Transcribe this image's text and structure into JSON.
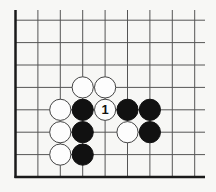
{
  "diagram": {
    "type": "go-board-fragment",
    "grid": {
      "origin_x": 15.5,
      "origin_y": 177,
      "spacing": 22.4,
      "cols": 9,
      "rows": 8,
      "top_y": 10,
      "right_x": 205
    },
    "colors": {
      "background": "#f7f7f5",
      "line": "#555555",
      "black_stone": "#111111",
      "white_stone": "#fdfdfd"
    },
    "stones": [
      {
        "color": "white",
        "col": 3,
        "row": 4,
        "label": ""
      },
      {
        "color": "white",
        "col": 4,
        "row": 4,
        "label": ""
      },
      {
        "color": "white",
        "col": 2,
        "row": 3,
        "label": ""
      },
      {
        "color": "black",
        "col": 3,
        "row": 3,
        "label": ""
      },
      {
        "color": "white",
        "col": 4,
        "row": 3,
        "label": "1"
      },
      {
        "color": "black",
        "col": 5,
        "row": 3,
        "label": ""
      },
      {
        "color": "black",
        "col": 6,
        "row": 3,
        "label": ""
      },
      {
        "color": "white",
        "col": 2,
        "row": 2,
        "label": ""
      },
      {
        "color": "black",
        "col": 3,
        "row": 2,
        "label": ""
      },
      {
        "color": "white",
        "col": 5,
        "row": 2,
        "label": ""
      },
      {
        "color": "black",
        "col": 6,
        "row": 2,
        "label": ""
      },
      {
        "color": "white",
        "col": 2,
        "row": 1,
        "label": ""
      },
      {
        "color": "black",
        "col": 3,
        "row": 1,
        "label": ""
      }
    ],
    "move_label": "1"
  }
}
